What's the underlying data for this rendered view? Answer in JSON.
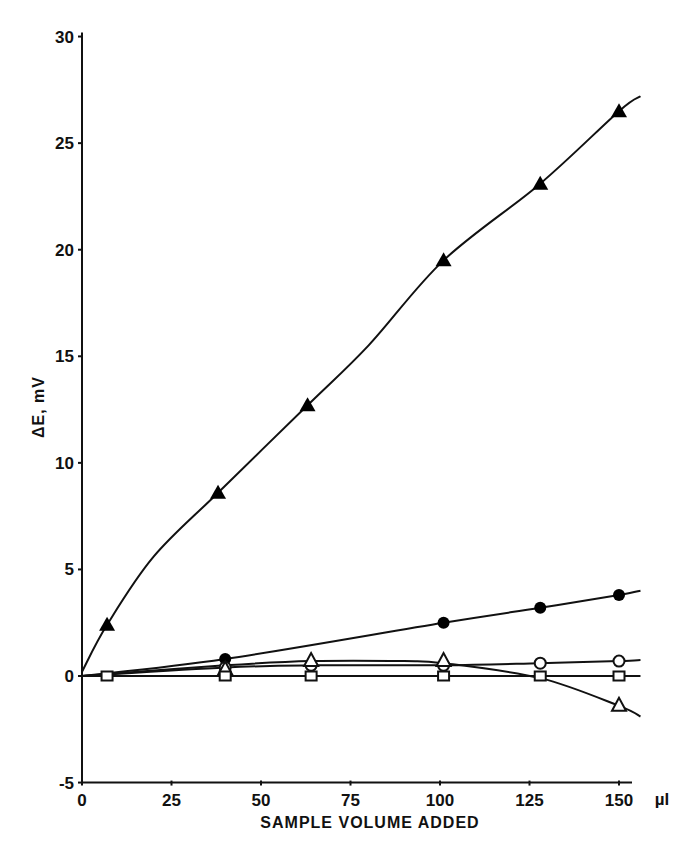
{
  "chart_data": {
    "type": "scatter",
    "title": "",
    "xlabel": "SAMPLE VOLUME ADDED",
    "x_unit": "µl",
    "ylabel": "ΔE, mV",
    "xlim": [
      0,
      160
    ],
    "ylim": [
      -5,
      30
    ],
    "x_ticks": [
      0,
      25,
      50,
      75,
      100,
      125,
      150
    ],
    "y_ticks": [
      -5,
      0,
      5,
      10,
      15,
      20,
      25,
      30
    ],
    "grid": false,
    "legend": null,
    "series": [
      {
        "name": "filled-triangle",
        "marker": "filled-triangle",
        "x": [
          7,
          38,
          63,
          101,
          128,
          150
        ],
        "y": [
          2.4,
          8.6,
          12.7,
          19.5,
          23.1,
          26.5
        ],
        "curve": [
          [
            0,
            0.2
          ],
          [
            7,
            2.4
          ],
          [
            20,
            5.6
          ],
          [
            38,
            8.6
          ],
          [
            63,
            12.7
          ],
          [
            80,
            15.5
          ],
          [
            101,
            19.5
          ],
          [
            128,
            23.1
          ],
          [
            150,
            26.5
          ],
          [
            156,
            27.2
          ]
        ]
      },
      {
        "name": "filled-circle",
        "marker": "filled-circle",
        "x": [
          40,
          101,
          128,
          150
        ],
        "y": [
          0.8,
          2.5,
          3.2,
          3.8
        ],
        "curve": [
          [
            0,
            0
          ],
          [
            40,
            0.8
          ],
          [
            101,
            2.5
          ],
          [
            128,
            3.2
          ],
          [
            150,
            3.8
          ],
          [
            156,
            4.0
          ]
        ]
      },
      {
        "name": "open-circle",
        "marker": "open-circle",
        "x": [
          40,
          64,
          101,
          128,
          150
        ],
        "y": [
          0.4,
          0.5,
          0.5,
          0.6,
          0.7
        ],
        "curve": [
          [
            0,
            0
          ],
          [
            40,
            0.4
          ],
          [
            64,
            0.5
          ],
          [
            101,
            0.5
          ],
          [
            128,
            0.6
          ],
          [
            150,
            0.7
          ],
          [
            156,
            0.75
          ]
        ]
      },
      {
        "name": "open-triangle",
        "marker": "open-triangle",
        "x": [
          40,
          64,
          101,
          150
        ],
        "y": [
          0.3,
          0.7,
          0.7,
          -1.4
        ],
        "curve": [
          [
            0,
            0
          ],
          [
            40,
            0.5
          ],
          [
            64,
            0.7
          ],
          [
            90,
            0.7
          ],
          [
            101,
            0.6
          ],
          [
            128,
            -0.1
          ],
          [
            150,
            -1.4
          ],
          [
            156,
            -1.9
          ]
        ]
      },
      {
        "name": "open-square",
        "marker": "open-square",
        "x": [
          7,
          40,
          64,
          101,
          128,
          150
        ],
        "y": [
          0,
          0,
          0,
          0,
          0,
          0
        ],
        "curve": [
          [
            0,
            0
          ],
          [
            156,
            0
          ]
        ]
      }
    ]
  },
  "axes": {
    "x_title": "SAMPLE VOLUME ADDED",
    "x_unit": "µl",
    "y_title": "ΔE, mV",
    "x_tick_labels": [
      "0",
      "25",
      "50",
      "75",
      "100",
      "125",
      "150"
    ],
    "y_tick_labels": [
      "-5",
      "0",
      "5",
      "10",
      "15",
      "20",
      "25",
      "30"
    ]
  }
}
